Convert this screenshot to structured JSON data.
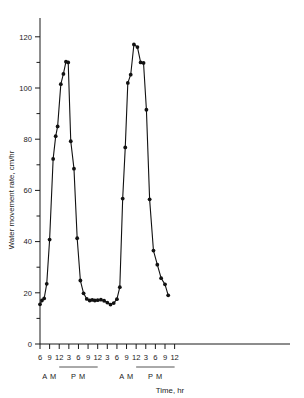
{
  "chart_data": {
    "type": "line",
    "title": "",
    "xlabel": "Time, hr",
    "ylabel": "Water movement rate, cm/hr",
    "xlim": [
      6,
      84
    ],
    "ylim": [
      0,
      125
    ],
    "grid": false,
    "legend": "none",
    "y_ticks_major": [
      0,
      20,
      40,
      60,
      80,
      100,
      120
    ],
    "y_ticks_minor": [
      10,
      30,
      50,
      70,
      90,
      110
    ],
    "x_tick_labels": [
      "6",
      "9",
      "12",
      "3",
      "6",
      "9",
      "12",
      "3",
      "6",
      "9",
      "12",
      "3",
      "6",
      "9",
      "12"
    ],
    "x_tick_hours": [
      6,
      9,
      12,
      15,
      18,
      21,
      24,
      27,
      30,
      33,
      36,
      39,
      42,
      45,
      48
    ],
    "period_labels": [
      "A M",
      "P M",
      "A M",
      "P M"
    ],
    "series": [
      {
        "name": "Water movement rate",
        "x": [
          6.0,
          6.6,
          7.3,
          8.1,
          9.0,
          10.1,
          10.9,
          11.5,
          12.5,
          13.3,
          14.1,
          14.8,
          15.6,
          16.6,
          17.6,
          18.6,
          19.6,
          20.6,
          21.5,
          22.3,
          23.1,
          24.0,
          25.0,
          26.0,
          27.0,
          28.0,
          29.0,
          30.0,
          30.9,
          31.8,
          32.6,
          33.4,
          34.3,
          35.3,
          36.4,
          37.4,
          38.3,
          39.2,
          40.2,
          41.4,
          42.6,
          43.8,
          45.0,
          46.0
        ],
        "y": [
          15.5,
          17.0,
          17.8,
          23.5,
          40.8,
          72.3,
          81.2,
          85.0,
          101.5,
          105.5,
          110.3,
          110.0,
          79.2,
          68.5,
          41.3,
          24.8,
          19.8,
          17.6,
          17.0,
          17.2,
          17.0,
          17.1,
          17.3,
          16.9,
          16.2,
          15.4,
          16.0,
          17.5,
          22.2,
          56.8,
          76.8,
          102.0,
          105.2,
          117.0,
          116.0,
          110.0,
          109.8,
          91.5,
          56.5,
          36.5,
          31.0,
          25.7,
          23.3,
          19.0
        ]
      }
    ]
  }
}
